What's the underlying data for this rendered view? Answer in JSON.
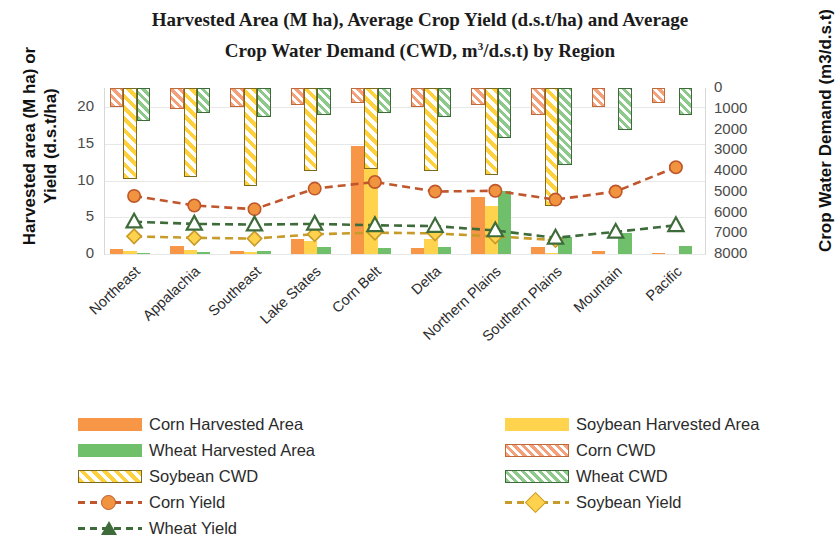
{
  "chart_data": {
    "type": "bar",
    "title": "Harvested Area (M ha), Average Crop Yield (d.s.t/ha) and Average Crop Water Demand (CWD, m3/d.s.t) by Region",
    "title_line1": "Harvested Area (M ha), Average Crop Yield (d.s.t/ha) and Average",
    "title_line2a": "Crop Water Demand (CWD, m",
    "title_line2sup": "3",
    "title_line2b": "/d.s.t) by Region",
    "xlabel": "",
    "ylabel": "Harvested area (M ha) or Yield (d.s.t/ha)",
    "y2label": "Crop Water Demand (m3/d.s.t)",
    "ylim": [
      0,
      22
    ],
    "y2lim": [
      0,
      8000
    ],
    "y2_inverted": true,
    "grid": true,
    "legend_position": "bottom",
    "yticks": [
      "0",
      "5",
      "10",
      "15",
      "20"
    ],
    "ytick_values": [
      0,
      5,
      10,
      15,
      20
    ],
    "y2ticks": [
      "0",
      "1000",
      "2000",
      "3000",
      "4000",
      "5000",
      "6000",
      "7000",
      "8000"
    ],
    "y2tick_values": [
      0,
      1000,
      2000,
      3000,
      4000,
      5000,
      6000,
      7000,
      8000
    ],
    "categories": [
      "Northeast",
      "Appalachia",
      "Southeast",
      "Lake States",
      "Corn Belt",
      "Delta",
      "Northern Plains",
      "Southern Plains",
      "Mountain",
      "Pacific"
    ],
    "series": [
      {
        "name": "Corn Harvested Area",
        "axis": "left",
        "kind": "bar",
        "color": "#f79646",
        "values": [
          0.7,
          1.1,
          0.35,
          2.0,
          14.7,
          0.8,
          7.7,
          0.9,
          0.4,
          0.15
        ]
      },
      {
        "name": "Soybean Harvested Area",
        "axis": "left",
        "kind": "bar",
        "color": "#ffd34d",
        "values": [
          0.35,
          0.6,
          0.25,
          1.8,
          13.5,
          2.0,
          6.5,
          0.2,
          0.0,
          0.0
        ]
      },
      {
        "name": "Wheat Harvested Area",
        "axis": "left",
        "kind": "bar",
        "color": "#70bf6a",
        "values": [
          0.15,
          0.3,
          0.35,
          0.9,
          0.8,
          0.9,
          8.6,
          2.3,
          2.8,
          1.1
        ]
      },
      {
        "name": "Corn CWD",
        "axis": "right",
        "kind": "bar-hatch",
        "color": "#f4a07a",
        "values": [
          900,
          1000,
          900,
          800,
          700,
          900,
          800,
          1300,
          900,
          700
        ]
      },
      {
        "name": "Soybean CWD",
        "axis": "right",
        "kind": "bar-hatch",
        "color": "#ffd23d",
        "values": [
          4400,
          4300,
          4700,
          4000,
          3900,
          4000,
          4200,
          5700,
          0,
          0
        ]
      },
      {
        "name": "Wheat CWD",
        "axis": "right",
        "kind": "bar-hatch",
        "color": "#8cc98a",
        "values": [
          1600,
          1200,
          1400,
          1300,
          1200,
          1400,
          2400,
          3700,
          2000,
          1300
        ]
      },
      {
        "name": "Corn Yield",
        "axis": "left",
        "kind": "line",
        "color": "#ed8b3c",
        "marker": "circle",
        "values": [
          7.9,
          6.6,
          6.1,
          8.9,
          9.8,
          8.5,
          8.6,
          7.4,
          8.5,
          11.8
        ]
      },
      {
        "name": "Soybean Yield",
        "axis": "left",
        "kind": "line",
        "color": "#f5c242",
        "marker": "diamond",
        "values": [
          2.4,
          2.2,
          2.1,
          2.7,
          2.9,
          2.8,
          2.4,
          1.9,
          0.0,
          0.0
        ]
      },
      {
        "name": "Wheat Yield",
        "axis": "left",
        "kind": "line",
        "color": "#3e6b3a",
        "marker": "triangle",
        "values": [
          4.4,
          4.1,
          4.0,
          4.1,
          3.9,
          3.8,
          3.2,
          2.2,
          3.0,
          3.9
        ]
      }
    ]
  },
  "legend": {
    "left_column": [
      "Corn Harvested Area",
      "Wheat Harvested Area",
      "Soybean CWD",
      "Corn Yield",
      "Wheat Yield"
    ],
    "right_column": [
      "Soybean Harvested Area",
      "Corn CWD",
      "Wheat CWD",
      "Soybean Yield"
    ]
  }
}
